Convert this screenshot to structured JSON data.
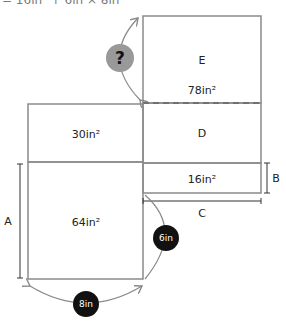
{
  "header": {
    "clipped_text": "= 16in² + 6in × 8in"
  },
  "regions": {
    "E": {
      "letter": "E",
      "area": "78in²"
    },
    "D": {
      "letter": "D"
    },
    "top_left": {
      "area": "30in²"
    },
    "bottom_left": {
      "area": "64in²"
    },
    "small_right": {
      "area": "16in²"
    }
  },
  "dimensions": {
    "A": "A",
    "B": "B",
    "C": "C"
  },
  "badges": {
    "question": "?",
    "six": "6in",
    "eight": "8in"
  },
  "colors": {
    "line": "#8a8a8a",
    "badge": "#111111",
    "question_fill": "#999999"
  }
}
